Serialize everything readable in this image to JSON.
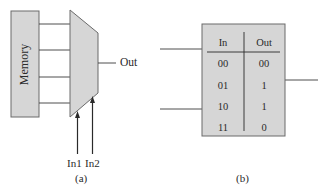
{
  "figure_a": {
    "memory_label": "Memory",
    "output_label": "Out",
    "input_labels": [
      "In1",
      "In2"
    ],
    "caption": "(a)",
    "memory_to_mux_lines": 4
  },
  "figure_b": {
    "caption": "(b)",
    "table": {
      "headers": [
        "In",
        "Out"
      ],
      "rows": [
        {
          "in": "00",
          "out": "00"
        },
        {
          "in": "01",
          "out": "1"
        },
        {
          "in": "10",
          "out": "1"
        },
        {
          "in": "11",
          "out": "0"
        }
      ]
    },
    "input_lines": 2,
    "output_lines": 1
  },
  "colors": {
    "fill": "#d6d6d6",
    "stroke": "#5a5a5a",
    "line": "#3a3a3a"
  }
}
